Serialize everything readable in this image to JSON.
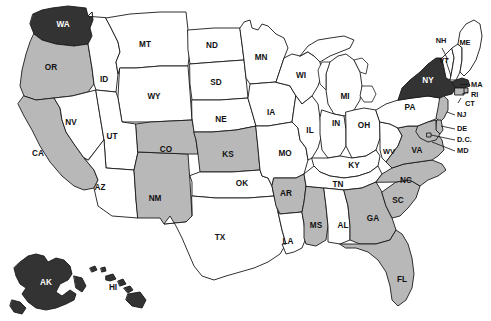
{
  "map": {
    "title": "United States choropleth map",
    "projection": "albers-usa",
    "background_color": "#ffffff",
    "border_color": "#1a1a1a",
    "legend_categories": [
      {
        "key": "dark",
        "color": "#333333",
        "label": "Dark"
      },
      {
        "key": "gray",
        "color": "#b8b8b8",
        "label": "Gray"
      },
      {
        "key": "white",
        "color": "#ffffff",
        "label": "White"
      }
    ],
    "states": [
      {
        "code": "WA",
        "name": "Washington",
        "category": "dark",
        "label_x": 63,
        "label_y": 25
      },
      {
        "code": "OR",
        "name": "Oregon",
        "category": "gray",
        "label_x": 51,
        "label_y": 68
      },
      {
        "code": "CA",
        "name": "California",
        "category": "gray",
        "label_x": 38,
        "label_y": 154
      },
      {
        "code": "NV",
        "name": "Nevada",
        "category": "white",
        "label_x": 71,
        "label_y": 123
      },
      {
        "code": "ID",
        "name": "Idaho",
        "category": "white",
        "label_x": 104,
        "label_y": 80
      },
      {
        "code": "MT",
        "name": "Montana",
        "category": "white",
        "label_x": 145,
        "label_y": 45
      },
      {
        "code": "WY",
        "name": "Wyoming",
        "category": "white",
        "label_x": 154,
        "label_y": 97
      },
      {
        "code": "UT",
        "name": "Utah",
        "category": "white",
        "label_x": 112,
        "label_y": 137
      },
      {
        "code": "AZ",
        "name": "Arizona",
        "category": "white",
        "label_x": 100,
        "label_y": 188
      },
      {
        "code": "NM",
        "name": "New Mexico",
        "category": "gray",
        "label_x": 155,
        "label_y": 199
      },
      {
        "code": "CO",
        "name": "Colorado",
        "category": "gray",
        "label_x": 166,
        "label_y": 150
      },
      {
        "code": "ND",
        "name": "North Dakota",
        "category": "white",
        "label_x": 212,
        "label_y": 46
      },
      {
        "code": "SD",
        "name": "South Dakota",
        "category": "white",
        "label_x": 216,
        "label_y": 83
      },
      {
        "code": "NE",
        "name": "Nebraska",
        "category": "white",
        "label_x": 221,
        "label_y": 120
      },
      {
        "code": "KS",
        "name": "Kansas",
        "category": "gray",
        "label_x": 228,
        "label_y": 155
      },
      {
        "code": "OK",
        "name": "Oklahoma",
        "category": "white",
        "label_x": 242,
        "label_y": 184
      },
      {
        "code": "TX",
        "name": "Texas",
        "category": "white",
        "label_x": 220,
        "label_y": 238
      },
      {
        "code": "MN",
        "name": "Minnesota",
        "category": "white",
        "label_x": 261,
        "label_y": 58
      },
      {
        "code": "IA",
        "name": "Iowa",
        "category": "white",
        "label_x": 271,
        "label_y": 113
      },
      {
        "code": "MO",
        "name": "Missouri",
        "category": "white",
        "label_x": 285,
        "label_y": 154
      },
      {
        "code": "AR",
        "name": "Arkansas",
        "category": "gray",
        "label_x": 286,
        "label_y": 194
      },
      {
        "code": "LA",
        "name": "Louisiana",
        "category": "white",
        "label_x": 288,
        "label_y": 242
      },
      {
        "code": "WI",
        "name": "Wisconsin",
        "category": "white",
        "label_x": 301,
        "label_y": 76
      },
      {
        "code": "IL",
        "name": "Illinois",
        "category": "white",
        "label_x": 310,
        "label_y": 131
      },
      {
        "code": "MS",
        "name": "Mississippi",
        "category": "gray",
        "label_x": 316,
        "label_y": 226
      },
      {
        "code": "MI",
        "name": "Michigan",
        "category": "white",
        "label_x": 345,
        "label_y": 97
      },
      {
        "code": "IN",
        "name": "Indiana",
        "category": "white",
        "label_x": 336,
        "label_y": 124
      },
      {
        "code": "OH",
        "name": "Ohio",
        "category": "white",
        "label_x": 364,
        "label_y": 126
      },
      {
        "code": "KY",
        "name": "Kentucky",
        "category": "white",
        "label_x": 354,
        "label_y": 166
      },
      {
        "code": "TN",
        "name": "Tennessee",
        "category": "white",
        "label_x": 338,
        "label_y": 185
      },
      {
        "code": "AL",
        "name": "Alabama",
        "category": "white",
        "label_x": 343,
        "label_y": 226
      },
      {
        "code": "GA",
        "name": "Georgia",
        "category": "gray",
        "label_x": 373,
        "label_y": 219
      },
      {
        "code": "FL",
        "name": "Florida",
        "category": "gray",
        "label_x": 402,
        "label_y": 280
      },
      {
        "code": "SC",
        "name": "South Carolina",
        "category": "gray",
        "label_x": 398,
        "label_y": 201
      },
      {
        "code": "NC",
        "name": "North Carolina",
        "category": "gray",
        "label_x": 406,
        "label_y": 181
      },
      {
        "code": "WV",
        "name": "West Virginia",
        "category": "white",
        "label_x": 389,
        "label_y": 152
      },
      {
        "code": "VA",
        "name": "Virginia",
        "category": "gray",
        "label_x": 417,
        "label_y": 151
      },
      {
        "code": "PA",
        "name": "Pennsylvania",
        "category": "white",
        "label_x": 410,
        "label_y": 108
      },
      {
        "code": "NY",
        "name": "New York",
        "category": "dark",
        "label_x": 428,
        "label_y": 81
      },
      {
        "code": "VT",
        "name": "Vermont",
        "category": "white",
        "label_x": 444,
        "label_y": 61
      },
      {
        "code": "NH",
        "name": "New Hampshire",
        "category": "white",
        "label_x": 441,
        "label_y": 41
      },
      {
        "code": "ME",
        "name": "Maine",
        "category": "white",
        "label_x": 465,
        "label_y": 43
      },
      {
        "code": "MA",
        "name": "Massachusetts",
        "category": "dark",
        "label_x": 475,
        "label_y": 85
      },
      {
        "code": "RI",
        "name": "Rhode Island",
        "category": "gray",
        "label_x": 474,
        "label_y": 95
      },
      {
        "code": "CT",
        "name": "Connecticut",
        "category": "gray",
        "label_x": 472,
        "label_y": 104
      },
      {
        "code": "NJ",
        "name": "New Jersey",
        "category": "gray",
        "label_x": 461,
        "label_y": 115
      },
      {
        "code": "DE",
        "name": "Delaware",
        "category": "gray",
        "label_x": 461,
        "label_y": 129
      },
      {
        "code": "DC",
        "name": "D.C.",
        "category": "gray",
        "label_x": 463,
        "label_y": 140
      },
      {
        "code": "MD",
        "name": "Maryland",
        "category": "gray",
        "label_x": 462,
        "label_y": 151
      },
      {
        "code": "AK",
        "name": "Alaska",
        "category": "dark",
        "label_x": 46,
        "label_y": 283
      },
      {
        "code": "HI",
        "name": "Hawaii",
        "category": "dark",
        "label_x": 113,
        "label_y": 288
      }
    ],
    "labels": {
      "WA": "WA",
      "OR": "OR",
      "CA": "CA",
      "NV": "NV",
      "ID": "ID",
      "MT": "MT",
      "WY": "WY",
      "UT": "UT",
      "AZ": "AZ",
      "NM": "NM",
      "CO": "CO",
      "ND": "ND",
      "SD": "SD",
      "NE": "NE",
      "KS": "KS",
      "OK": "OK",
      "TX": "TX",
      "MN": "MN",
      "IA": "IA",
      "MO": "MO",
      "AR": "AR",
      "LA": "LA",
      "WI": "WI",
      "IL": "IL",
      "MS": "MS",
      "MI": "MI",
      "IN": "IN",
      "OH": "OH",
      "KY": "KY",
      "TN": "TN",
      "AL": "AL",
      "GA": "GA",
      "FL": "FL",
      "SC": "SC",
      "NC": "NC",
      "WV": "WV",
      "VA": "VA",
      "PA": "PA",
      "NY": "NY",
      "VT": "VT",
      "NH": "NH",
      "ME": "ME",
      "MA": "MA",
      "RI": "RI",
      "CT": "CT",
      "NJ": "NJ",
      "DE": "DE",
      "DC": "D.C.",
      "MD": "MD",
      "AK": "AK",
      "HI": "HI"
    }
  }
}
